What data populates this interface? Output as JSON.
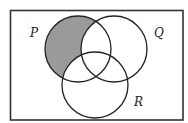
{
  "diagram": {
    "type": "venn",
    "sets": [
      {
        "id": "P",
        "label": "P",
        "cx": 78,
        "cy": 49,
        "r": 33
      },
      {
        "id": "Q",
        "label": "Q",
        "cx": 114,
        "cy": 49,
        "r": 33
      },
      {
        "id": "R",
        "label": "R",
        "cx": 95,
        "cy": 85,
        "r": 33
      }
    ],
    "shaded_region": "P only (P minus Q union R)",
    "colors": {
      "shade": "#9a9a9a",
      "stroke": "#222222",
      "background": "#ffffff"
    }
  }
}
